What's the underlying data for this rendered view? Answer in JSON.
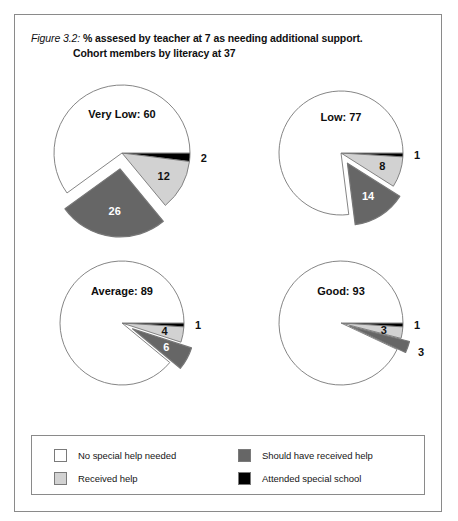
{
  "figure": {
    "number": "Figure 3.2:",
    "caption_line1": "% assesed by teacher at 7 as needing additional support.",
    "caption_line2": "Cohort members by literacy at 37"
  },
  "colors": {
    "no_special_help": "#ffffff",
    "received_help": "#d2d2d2",
    "should_have_received_help": "#666666",
    "attended_special_school": "#000000",
    "outline": "#777777",
    "frame": "#8a8a8a"
  },
  "legend": {
    "items": [
      {
        "label": "No special help needed",
        "color": "#ffffff",
        "swatch": "legend-swatch-no-special-help"
      },
      {
        "label": "Received help",
        "color": "#d2d2d2",
        "swatch": "legend-swatch-received-help"
      },
      {
        "label": "Should have received help",
        "color": "#666666",
        "swatch": "legend-swatch-should-have-received-help"
      },
      {
        "label": "Attended special school",
        "color": "#000000",
        "swatch": "legend-swatch-attended-special-school"
      }
    ]
  },
  "chart_data": {
    "type": "pie",
    "title": "Figure 3.2: % assesed by teacher at 7 as needing additional support. Cohort members by literacy at 37",
    "legend_position": "bottom",
    "categories": [
      "No special help needed",
      "Attended special school",
      "Received help",
      "Should have received help"
    ],
    "charts": [
      {
        "name": "Very Low",
        "title": "Very Low: 60",
        "values": [
          60,
          2,
          12,
          26
        ],
        "slices": [
          {
            "category": "Attended special school",
            "value": 2,
            "label": "2",
            "color": "#000000",
            "exploded": false,
            "label_placement": "outside"
          },
          {
            "category": "Received help",
            "value": 12,
            "label": "12",
            "color": "#d2d2d2",
            "exploded": false,
            "label_placement": "inside-light"
          },
          {
            "category": "Should have received help",
            "value": 26,
            "label": "26",
            "color": "#666666",
            "exploded": true,
            "label_placement": "inside-dark"
          },
          {
            "category": "No special help needed",
            "value": 60,
            "label": "",
            "color": "#ffffff",
            "exploded": false,
            "label_placement": "none"
          }
        ]
      },
      {
        "name": "Low",
        "title": "Low: 77",
        "values": [
          77,
          1,
          8,
          14
        ],
        "slices": [
          {
            "category": "Attended special school",
            "value": 1,
            "label": "1",
            "color": "#000000",
            "exploded": false,
            "label_placement": "outside"
          },
          {
            "category": "Received help",
            "value": 8,
            "label": "8",
            "color": "#d2d2d2",
            "exploded": false,
            "label_placement": "inside-light"
          },
          {
            "category": "Should have received help",
            "value": 14,
            "label": "14",
            "color": "#666666",
            "exploded": true,
            "label_placement": "inside-dark"
          },
          {
            "category": "No special help needed",
            "value": 77,
            "label": "",
            "color": "#ffffff",
            "exploded": false,
            "label_placement": "none"
          }
        ]
      },
      {
        "name": "Average",
        "title": "Average: 89",
        "values": [
          89,
          1,
          4,
          6
        ],
        "slices": [
          {
            "category": "Attended special school",
            "value": 1,
            "label": "1",
            "color": "#000000",
            "exploded": false,
            "label_placement": "outside"
          },
          {
            "category": "Received help",
            "value": 4,
            "label": "4",
            "color": "#d2d2d2",
            "exploded": false,
            "label_placement": "inside-light"
          },
          {
            "category": "Should have received help",
            "value": 6,
            "label": "6",
            "color": "#666666",
            "exploded": true,
            "label_placement": "inside-dark"
          },
          {
            "category": "No special help needed",
            "value": 89,
            "label": "",
            "color": "#ffffff",
            "exploded": false,
            "label_placement": "none"
          }
        ]
      },
      {
        "name": "Good",
        "title": "Good: 93",
        "values": [
          93,
          1,
          3,
          3
        ],
        "slices": [
          {
            "category": "Attended special school",
            "value": 1,
            "label": "1",
            "color": "#000000",
            "exploded": false,
            "label_placement": "outside"
          },
          {
            "category": "Received help",
            "value": 3,
            "label": "3",
            "color": "#d2d2d2",
            "exploded": false,
            "label_placement": "inside-light"
          },
          {
            "category": "Should have received help",
            "value": 3,
            "label": "3",
            "color": "#666666",
            "exploded": true,
            "label_placement": "outside"
          },
          {
            "category": "No special help needed",
            "value": 93,
            "label": "",
            "color": "#ffffff",
            "exploded": false,
            "label_placement": "none"
          }
        ]
      }
    ]
  }
}
